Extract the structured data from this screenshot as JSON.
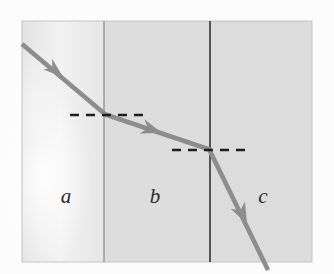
{
  "figure": {
    "type": "optics-refraction-diagram",
    "caption_text": "",
    "background_color": "#fdfdfd",
    "panel": {
      "x": 22,
      "y": 21,
      "width": 290,
      "height": 241,
      "border_color": "#b9b9b9"
    },
    "media": [
      {
        "id": "a",
        "label": "a",
        "label_x": 66,
        "label_y": 203,
        "fill_color": "#ededed",
        "x_start": 22,
        "x_end": 104
      },
      {
        "id": "b",
        "label": "b",
        "label_x": 154,
        "label_y": 203,
        "fill_color": "#dcdcdc",
        "x_start": 104,
        "x_end": 210
      },
      {
        "id": "c",
        "label": "c",
        "label_x": 262,
        "label_y": 203,
        "fill_color": "#dbdbdb",
        "x_start": 210,
        "x_end": 312
      }
    ],
    "boundaries": [
      {
        "name": "boundary-a-b",
        "x": 104,
        "y_top": 21,
        "y_bottom": 262,
        "color": "#8c8c8c",
        "width": 1.3
      },
      {
        "name": "boundary-b-c",
        "x": 210,
        "y_top": 21,
        "y_bottom": 262,
        "color": "#3a3a3a",
        "width": 1.7
      }
    ],
    "normals": [
      {
        "name": "normal-at-boundary-a-b",
        "y": 115,
        "x_start": 70,
        "x_end": 146,
        "dash": "9 7",
        "color": "#1f1f1f",
        "width": 2.4
      },
      {
        "name": "normal-at-boundary-b-c",
        "y": 150,
        "x_start": 172,
        "x_end": 251,
        "dash": "9 7",
        "color": "#1f1f1f",
        "width": 2.4
      }
    ],
    "ray": {
      "color": "#8d8d8d",
      "width": 4.6,
      "points": [
        {
          "x": 22,
          "y": 44
        },
        {
          "x": 105,
          "y": 115
        },
        {
          "x": 210,
          "y": 150
        },
        {
          "x": 268,
          "y": 268
        }
      ],
      "arrowheads": [
        {
          "name": "arrowhead-incident",
          "x": 62,
          "y": 76,
          "angle_deg": 40
        },
        {
          "name": "arrowhead-medium-b",
          "x": 160,
          "y": 132,
          "angle_deg": 18
        },
        {
          "name": "arrowhead-medium-c",
          "x": 246,
          "y": 222,
          "angle_deg": 64
        }
      ]
    },
    "glare": {
      "name": "page-glare-highlight",
      "cx": 44,
      "cy": 180,
      "rx": 46,
      "ry": 92,
      "color": "#ffffff",
      "opacity": 0.72
    }
  }
}
